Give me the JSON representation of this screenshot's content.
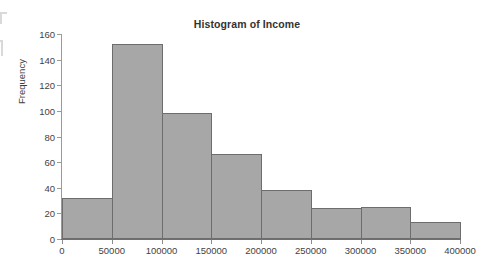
{
  "chart_data": {
    "type": "bar",
    "title": "Histogram of Income",
    "xlabel": "",
    "ylabel": "Frequency",
    "xlim": [
      0,
      400000
    ],
    "ylim": [
      0,
      160
    ],
    "grid": false,
    "legend": null,
    "bin_width": 50000,
    "bin_edges": [
      0,
      50000,
      100000,
      150000,
      200000,
      250000,
      300000,
      350000,
      400000
    ],
    "categories": [
      "0-50000",
      "50000-100000",
      "100000-150000",
      "150000-200000",
      "200000-250000",
      "250000-300000",
      "300000-350000",
      "350000-400000"
    ],
    "values": [
      32,
      152,
      98,
      66,
      38,
      24,
      25,
      13
    ],
    "x_ticks": [
      0,
      50000,
      100000,
      150000,
      200000,
      250000,
      300000,
      350000,
      400000
    ],
    "x_tick_labels": [
      "0",
      "50000",
      "100000",
      "150000",
      "200000",
      "250000",
      "300000",
      "350000",
      "400000"
    ],
    "y_ticks": [
      0,
      20,
      40,
      60,
      80,
      100,
      120,
      140,
      160
    ],
    "y_tick_labels": [
      "0",
      "20",
      "40",
      "60",
      "80",
      "100",
      "120",
      "140",
      "160"
    ],
    "bar_fill_color": "#a7a7a7",
    "bar_edge_color": "#6d6d6d",
    "axis_color": "#8c8c8c",
    "title_color": "#333333"
  }
}
